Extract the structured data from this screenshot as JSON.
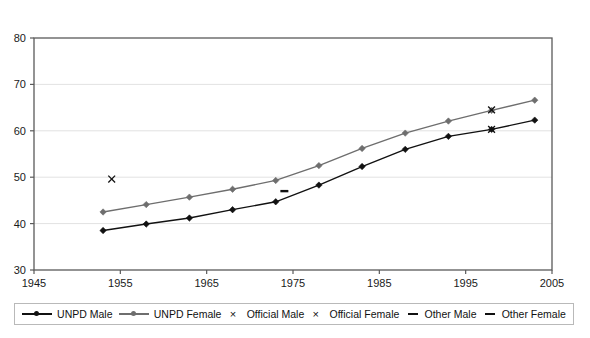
{
  "chart_data": {
    "type": "line",
    "title": "",
    "xlabel": "",
    "ylabel": "",
    "xlim": [
      1945,
      2005
    ],
    "ylim": [
      30,
      80
    ],
    "xticks": [
      1945,
      1955,
      1965,
      1975,
      1985,
      1995,
      2005
    ],
    "yticks": [
      30,
      40,
      50,
      60,
      70,
      80
    ],
    "grid": "horizontal",
    "legend_position": "bottom",
    "x": [
      1953,
      1958,
      1963,
      1968,
      1973,
      1978,
      1983,
      1988,
      1993,
      1998,
      2003
    ],
    "series": [
      {
        "name": "UNPD Male",
        "marker": "diamond",
        "color": "#111111",
        "values": [
          38.5,
          39.9,
          41.2,
          43.0,
          44.7,
          48.3,
          52.3,
          56.0,
          58.8,
          60.3,
          62.3
        ]
      },
      {
        "name": "UNPD Female",
        "marker": "diamond",
        "color": "#6e6e6e",
        "values": [
          42.5,
          44.1,
          45.7,
          47.4,
          49.3,
          52.5,
          56.2,
          59.5,
          62.1,
          64.4,
          66.6
        ]
      },
      {
        "name": "Official Male",
        "marker": "cross",
        "color": "#111111",
        "points": [
          {
            "x": 1954,
            "y": 49.6
          },
          {
            "x": 1998,
            "y": 60.3
          }
        ]
      },
      {
        "name": "Official Female",
        "marker": "cross",
        "color": "#111111",
        "points": [
          {
            "x": 1998,
            "y": 64.5
          }
        ]
      },
      {
        "name": "Other Male",
        "marker": "dash",
        "color": "#111111",
        "points": [
          {
            "x": 1974,
            "y": 47.0
          }
        ]
      },
      {
        "name": "Other Female",
        "marker": "dash",
        "color": "#111111",
        "points": []
      }
    ]
  },
  "axes": {
    "y_tick_labels": [
      "80",
      "70",
      "60",
      "50",
      "40",
      "30"
    ],
    "x_tick_labels": [
      "1945",
      "1955",
      "1965",
      "1975",
      "1985",
      "1995",
      "2005"
    ]
  },
  "legend": {
    "items": [
      {
        "label": "UNPD Male",
        "marker": "line-diamond",
        "color": "#111111"
      },
      {
        "label": "UNPD Female",
        "marker": "line-diamond",
        "color": "#6e6e6e"
      },
      {
        "label": "Official Male",
        "marker": "cross",
        "color": "#111111"
      },
      {
        "label": "Official Female",
        "marker": "cross",
        "color": "#111111"
      },
      {
        "label": "Other Male",
        "marker": "dash",
        "color": "#111111"
      },
      {
        "label": "Other Female",
        "marker": "dash",
        "color": "#111111"
      }
    ]
  },
  "colors": {
    "plot_border": "#5a5a5a",
    "gridline": "#e2e2e2",
    "background": "#ffffff",
    "text": "#111111"
  }
}
